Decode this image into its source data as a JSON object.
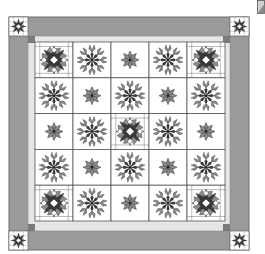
{
  "colors": {
    "background": "#ffffff",
    "outer_border": "#9a9a9a",
    "outer_border_edge": "#6e6e6e",
    "inner_strip": "#e6e6e6",
    "cornerstone_dark": "#7a7a7a",
    "block_bg": "#ffffff",
    "grid_line": "#555555",
    "fabric_dark": "#3a3a3a",
    "fabric_mid": "#8c8c8c",
    "fabric_light": "#d0d0d0"
  },
  "quilt": {
    "grid_rows": 5,
    "grid_cols": 5,
    "layout": [
      [
        "complex-star",
        "spiky-star",
        "small-star",
        "spiky-star",
        "complex-star"
      ],
      [
        "spiky-star",
        "small-star",
        "spiky-star",
        "small-star",
        "spiky-star"
      ],
      [
        "small-star",
        "spiky-star",
        "complex-star",
        "spiky-star",
        "small-star"
      ],
      [
        "spiky-star",
        "small-star",
        "spiky-star",
        "small-star",
        "spiky-star"
      ],
      [
        "complex-star",
        "spiky-star",
        "small-star",
        "spiky-star",
        "complex-star"
      ]
    ],
    "border_corner_blocks": [
      "complex-star",
      "complex-star",
      "complex-star",
      "complex-star"
    ]
  },
  "corner_icon": "page-curl-icon"
}
